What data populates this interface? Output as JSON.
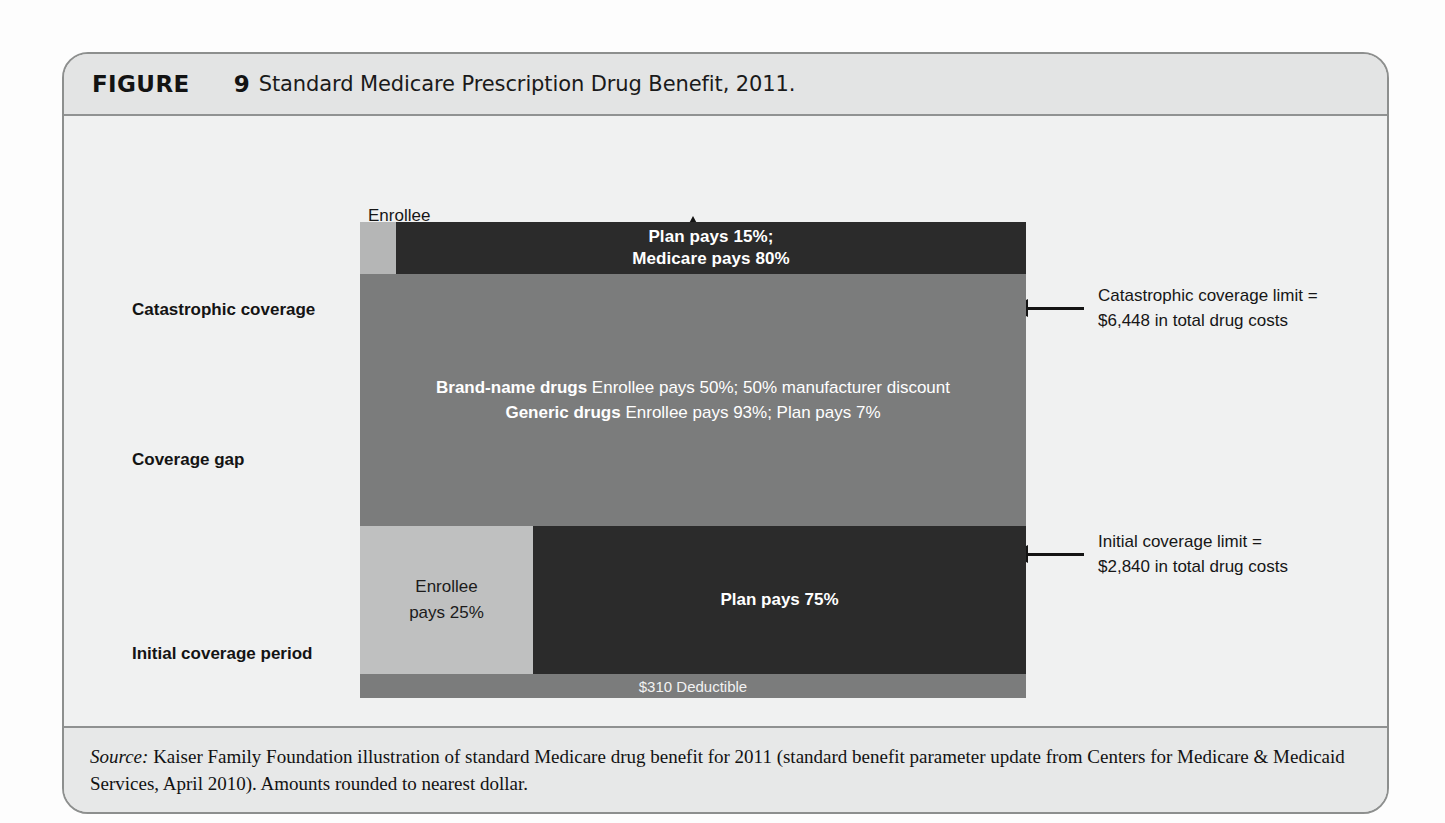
{
  "figure": {
    "label": "FIGURE",
    "number": "9",
    "title": "Standard Medicare Prescription Drug Benefit, 2011."
  },
  "row_labels": {
    "catastrophic": "Catastrophic coverage",
    "coverage_gap": "Coverage gap",
    "initial": "Initial coverage period"
  },
  "callouts": {
    "enrollee_5_line1": "Enrollee",
    "enrollee_5_line2": "pays 5%",
    "catastrophic_limit_line1": "Catastrophic coverage limit =",
    "catastrophic_limit_line2": "$6,448 in total drug costs",
    "initial_limit_line1": "Initial coverage limit =",
    "initial_limit_line2": "$2,840 in total drug costs"
  },
  "bands": {
    "catastrophic": {
      "main_line1": "Plan pays 15%;",
      "main_line2": "Medicare pays 80%"
    },
    "coverage_gap": {
      "brand_label": "Brand-name drugs",
      "brand_text": "Enrollee pays 50%; 50% manufacturer discount",
      "generic_label": "Generic drugs",
      "generic_text": "Enrollee pays 93%; Plan pays 7%"
    },
    "initial": {
      "enrollee_line1": "Enrollee",
      "enrollee_line2": "pays 25%",
      "plan_text": "Plan pays 75%"
    },
    "deductible": {
      "text": "$310 Deductible"
    }
  },
  "source": {
    "label": "Source:",
    "text": " Kaiser Family Foundation illustration of standard Medicare drug benefit for 2011 (standard benefit parameter update from Centers for Medicare & Medicaid Services, April 2010). Amounts rounded to nearest dollar."
  },
  "chart_data": {
    "type": "bar",
    "title": "Standard Medicare Prescription Drug Benefit, 2011",
    "orientation": "horizontal-stacked-phases",
    "categories": [
      "Initial coverage period",
      "Coverage gap",
      "Catastrophic coverage"
    ],
    "thresholds": [
      {
        "name": "Deductible",
        "value": 310,
        "unit": "USD",
        "label": "$310 Deductible"
      },
      {
        "name": "Initial coverage limit",
        "value": 2840,
        "unit": "USD",
        "label": "Initial coverage limit = $2,840 in total drug costs"
      },
      {
        "name": "Catastrophic coverage limit",
        "value": 6448,
        "unit": "USD",
        "label": "Catastrophic coverage limit = $6,448 in total drug costs"
      }
    ],
    "series": [
      {
        "phase": "Catastrophic coverage",
        "shares": [
          {
            "payer": "Enrollee",
            "percent": 5,
            "color": "#b5b6b6"
          },
          {
            "payer": "Plan",
            "percent": 15,
            "color": "#2b2b2b"
          },
          {
            "payer": "Medicare",
            "percent": 80,
            "color": "#2b2b2b"
          }
        ]
      },
      {
        "phase": "Coverage gap",
        "shares": [
          {
            "payer": "Enrollee (brand-name drugs)",
            "percent": 50,
            "color": "#7b7c7c"
          },
          {
            "payer": "Manufacturer discount (brand-name drugs)",
            "percent": 50,
            "color": "#7b7c7c"
          },
          {
            "payer": "Enrollee (generic drugs)",
            "percent": 93,
            "color": "#7b7c7c"
          },
          {
            "payer": "Plan (generic drugs)",
            "percent": 7,
            "color": "#7b7c7c"
          }
        ]
      },
      {
        "phase": "Initial coverage period",
        "shares": [
          {
            "payer": "Enrollee",
            "percent": 25,
            "color": "#bfc0c0"
          },
          {
            "payer": "Plan",
            "percent": 75,
            "color": "#2b2b2b"
          }
        ]
      }
    ],
    "ylabel": "Total drug costs",
    "xlabel": "",
    "grid": false,
    "legend": "none"
  }
}
